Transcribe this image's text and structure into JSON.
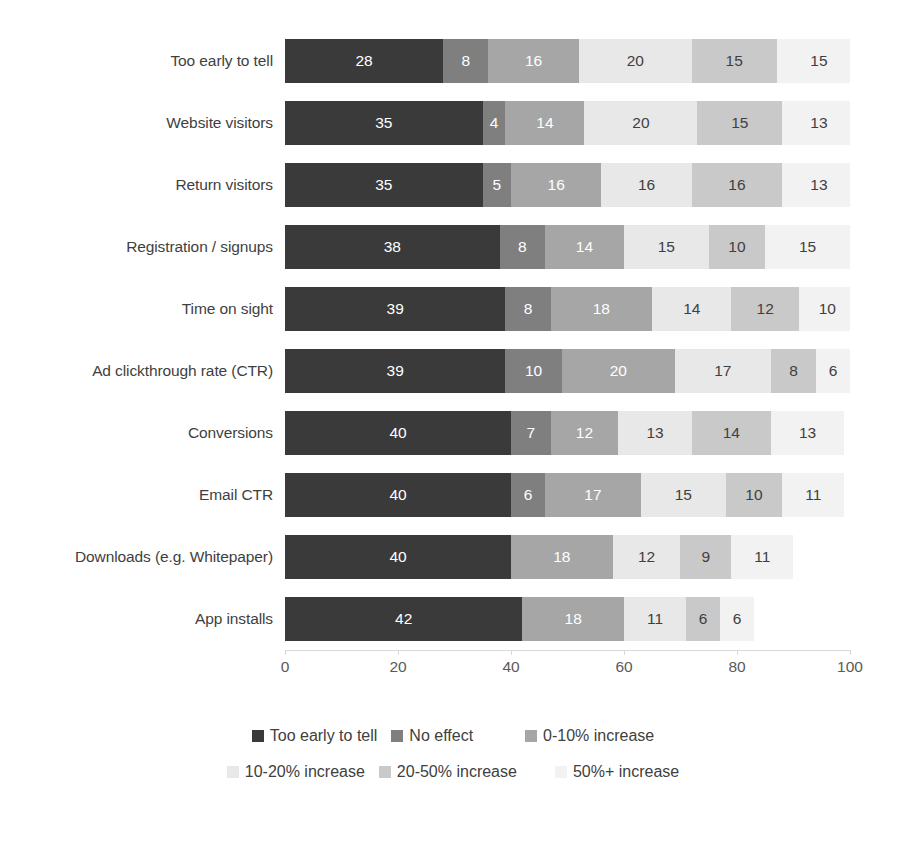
{
  "chart_data": {
    "type": "bar",
    "orientation": "horizontal",
    "stacked": true,
    "title": "",
    "subtitle": "",
    "xlabel": "",
    "ylabel": "",
    "xlim": [
      0,
      100
    ],
    "xticks": [
      "0",
      "20",
      "40",
      "60",
      "80",
      "100"
    ],
    "grid": false,
    "legend_position": "bottom",
    "categories": [
      "Too early to tell",
      "Website visitors",
      "Return visitors",
      "Registration / signups",
      "Time on sight",
      "Ad clickthrough rate (CTR)",
      "Conversions",
      "Email CTR",
      "Downloads (e.g. Whitepaper)",
      "App installs"
    ],
    "series": [
      {
        "name": "Too early to tell",
        "color": "#3a3a3a",
        "label_color": "light",
        "values": [
          28,
          35,
          35,
          38,
          39,
          39,
          40,
          40,
          40,
          42
        ]
      },
      {
        "name": "No effect",
        "color": "#7f7f7f",
        "label_color": "light",
        "values": [
          8,
          4,
          5,
          8,
          8,
          10,
          7,
          6,
          0,
          0
        ]
      },
      {
        "name": "0-10% increase",
        "color": "#a6a6a6",
        "label_color": "light",
        "values": [
          16,
          14,
          16,
          14,
          18,
          20,
          12,
          17,
          18,
          18
        ]
      },
      {
        "name": "10-20% increase",
        "color": "#e8e8e8",
        "label_color": "dark",
        "values": [
          20,
          20,
          16,
          15,
          14,
          17,
          13,
          15,
          12,
          11
        ]
      },
      {
        "name": "20-50% increase",
        "color": "#c9c9c9",
        "label_color": "dark",
        "values": [
          15,
          15,
          16,
          10,
          12,
          8,
          14,
          10,
          9,
          6
        ]
      },
      {
        "name": "50%+ increase",
        "color": "#f2f2f2",
        "label_color": "dark",
        "values": [
          15,
          13,
          13,
          15,
          10,
          6,
          13,
          11,
          11,
          6
        ]
      }
    ],
    "extra_trailing": {
      "note": "",
      "values": [
        null,
        null,
        null,
        null,
        null,
        null,
        null,
        null,
        10,
        17
      ]
    }
  },
  "legend": {
    "items": [
      {
        "label": "Too early to tell",
        "color": "#3a3a3a"
      },
      {
        "label": "No effect",
        "color": "#7f7f7f"
      },
      {
        "label": "0-10% increase",
        "color": "#a6a6a6"
      },
      {
        "label": "10-20% increase",
        "color": "#e8e8e8"
      },
      {
        "label": "20-50% increase",
        "color": "#c9c9c9"
      },
      {
        "label": "50%+ increase",
        "color": "#f2f2f2"
      }
    ]
  }
}
